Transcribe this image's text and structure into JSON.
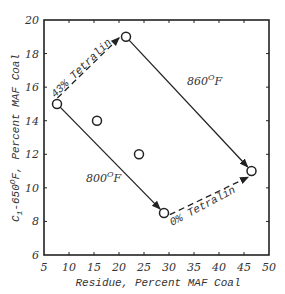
{
  "chart_data": {
    "type": "scatter",
    "title": "",
    "xlabel": "Residue, Percent MAF Coal",
    "ylabel": "C1-650°F, Percent MAF Coal",
    "ylabel_parts": {
      "c": "C",
      "sub": "1",
      "rest": "-650",
      "sup": "O",
      "tail": "F, Percent MAF Coal"
    },
    "xlim": [
      5,
      50
    ],
    "ylim": [
      6,
      20
    ],
    "x_ticks": [
      5,
      10,
      15,
      20,
      25,
      30,
      35,
      40,
      45,
      50
    ],
    "y_ticks": [
      6,
      8,
      10,
      12,
      14,
      16,
      18,
      20
    ],
    "grid": false,
    "legend": null,
    "points": [
      {
        "id": "p1",
        "x": 7.6,
        "y": 15.0
      },
      {
        "id": "p2",
        "x": 15.6,
        "y": 14.0
      },
      {
        "id": "p3",
        "x": 24.0,
        "y": 12.0
      },
      {
        "id": "p4",
        "x": 21.4,
        "y": 19.0
      },
      {
        "id": "p5",
        "x": 29.0,
        "y": 8.5
      },
      {
        "id": "p6",
        "x": 46.5,
        "y": 11.0
      }
    ],
    "arrows": [
      {
        "from": "p1",
        "to": "p4",
        "style": "dashed",
        "label": "43% Tetralin"
      },
      {
        "from": "p5",
        "to": "p6",
        "style": "dashed",
        "label": "0% Tetralin"
      },
      {
        "from": "p1",
        "to": "p5",
        "style": "solid",
        "label": "800°F"
      },
      {
        "from": "p4",
        "to": "p6",
        "style": "solid",
        "label": "860°F"
      }
    ],
    "annotations": [
      {
        "text": "43% Tetralin",
        "near": "p1-p4 dashed arrow"
      },
      {
        "text": "0% Tetralin",
        "near": "p5-p6 dashed arrow"
      },
      {
        "text": "800°F",
        "near": "p1-p5 solid arrow"
      },
      {
        "text": "860°F",
        "near": "p4-p6 solid arrow"
      }
    ]
  },
  "labels": {
    "tetralin43": "43% Tetralin",
    "tetralin0": "0% Tetralin",
    "temp800_num": "800",
    "temp860_num": "860",
    "deg": "O",
    "unit": "F"
  }
}
